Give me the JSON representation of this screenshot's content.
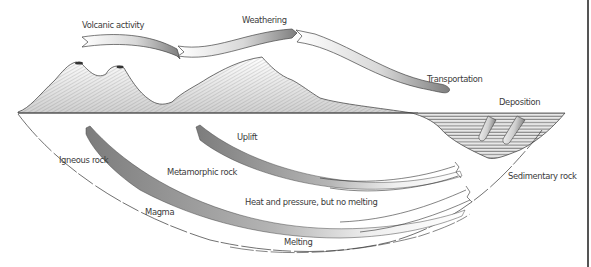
{
  "diagram": {
    "type": "rock-cycle",
    "labels": {
      "volcanic_activity": "Volcanic activity",
      "weathering": "Weathering",
      "transportation": "Transportation",
      "deposition": "Deposition",
      "uplift": "Uplift",
      "igneous_rock": "Igneous rock",
      "metamorphic_rock": "Metamorphic rock",
      "heat_pressure": "Heat and pressure, but no melting",
      "magma": "Magma",
      "melting": "Melting",
      "sedimentary_rock": "Sedimentary rock"
    },
    "colors": {
      "arrow_dark": "#8a8a8a",
      "arrow_light": "#f4f4f4",
      "line": "#333333",
      "text": "#3a3a3a"
    },
    "flow": [
      {
        "from": "Volcanic activity",
        "to": "Weathering"
      },
      {
        "from": "Weathering",
        "to": "Transportation"
      },
      {
        "from": "Transportation",
        "to": "Deposition"
      },
      {
        "from": "Deposition",
        "to": "Sedimentary rock"
      },
      {
        "from": "Sedimentary rock",
        "to": "Uplift"
      },
      {
        "from": "Sedimentary rock",
        "to": "Metamorphic rock",
        "via": "Heat and pressure, but no melting"
      },
      {
        "from": "Sedimentary rock",
        "to": "Magma",
        "via": "Melting"
      },
      {
        "from": "Magma",
        "to": "Igneous rock"
      }
    ]
  }
}
